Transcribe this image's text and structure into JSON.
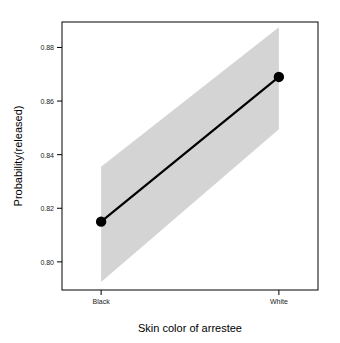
{
  "chart_data": {
    "type": "line",
    "title": "",
    "subtitle": "",
    "xlabel": "Skin color of arrestee",
    "ylabel": "Probability(released)",
    "categories": [
      "Black",
      "White"
    ],
    "x": [
      1,
      2
    ],
    "values": [
      0.815,
      0.869
    ],
    "series": [
      {
        "name": "Probability(released)",
        "values": [
          0.815,
          0.869
        ],
        "ci_lower": [
          0.7925,
          0.8495
        ],
        "ci_upper": [
          0.8355,
          0.8875
        ]
      }
    ],
    "ylim": [
      0.7895,
      0.8895
    ],
    "xlim": [
      0.78,
      2.22
    ],
    "yticks": [
      "0.80",
      "0.82",
      "0.84",
      "0.86",
      "0.88"
    ],
    "ytick_values": [
      0.8,
      0.82,
      0.84,
      0.86,
      0.88
    ],
    "xticks": [
      "Black",
      "White"
    ],
    "grid": false,
    "legend": "none",
    "band_label": "confidence band",
    "band_color": "#d4d4d4",
    "line_color": "#000000",
    "point_color": "#000000"
  },
  "axis": {
    "y_title": "Probability(released)",
    "x_title": "Skin color of arrestee",
    "y_tick_labels": [
      "0.88",
      "0.86",
      "0.84",
      "0.82",
      "0.80"
    ],
    "x_tick_labels": [
      "Black",
      "White"
    ]
  }
}
